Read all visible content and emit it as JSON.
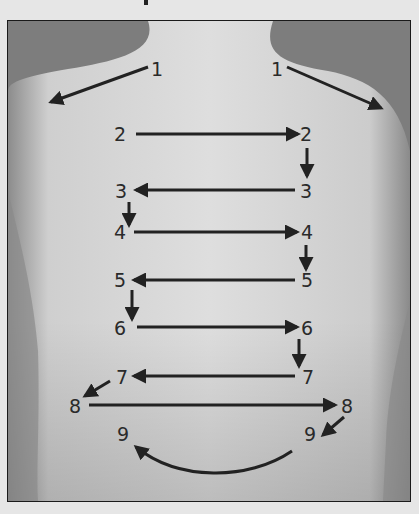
{
  "figure": {
    "colors": {
      "page_background": "#e6e6e6",
      "background_dark": "#7a7a7a",
      "skin_light": "#dcdcdc",
      "skin_shadow": "#a8a8a8",
      "arrow": "#222222",
      "label": "#2a2a2a"
    },
    "steps": [
      {
        "id": "1L",
        "label": "1",
        "side": "left",
        "direction": "outward-diagonal-down-left"
      },
      {
        "id": "1R",
        "label": "1",
        "side": "right",
        "direction": "outward-diagonal-down-right"
      },
      {
        "id": "2L",
        "label": "2",
        "side": "left",
        "direction": "left-to-right"
      },
      {
        "id": "2R",
        "label": "2",
        "side": "right",
        "direction": "down-to-3"
      },
      {
        "id": "3R",
        "label": "3",
        "side": "right",
        "direction": "right-to-left"
      },
      {
        "id": "3L",
        "label": "3",
        "side": "left",
        "direction": "down-to-4"
      },
      {
        "id": "4L",
        "label": "4",
        "side": "left",
        "direction": "left-to-right"
      },
      {
        "id": "4R",
        "label": "4",
        "side": "right",
        "direction": "down-to-5"
      },
      {
        "id": "5R",
        "label": "5",
        "side": "right",
        "direction": "right-to-left"
      },
      {
        "id": "5L",
        "label": "5",
        "side": "left",
        "direction": "down-to-6"
      },
      {
        "id": "6L",
        "label": "6",
        "side": "left",
        "direction": "left-to-right"
      },
      {
        "id": "6R",
        "label": "6",
        "side": "right",
        "direction": "down-to-7"
      },
      {
        "id": "7R",
        "label": "7",
        "side": "right",
        "direction": "right-to-left"
      },
      {
        "id": "7L",
        "label": "7",
        "side": "left",
        "direction": "diagonal-to-8"
      },
      {
        "id": "8L",
        "label": "8",
        "side": "left",
        "direction": "left-to-right"
      },
      {
        "id": "8R",
        "label": "8",
        "side": "right",
        "direction": "diagonal-to-9"
      },
      {
        "id": "9R",
        "label": "9",
        "side": "right",
        "direction": "curve-to-left-9"
      },
      {
        "id": "9L",
        "label": "9",
        "side": "left",
        "direction": "end"
      }
    ]
  }
}
